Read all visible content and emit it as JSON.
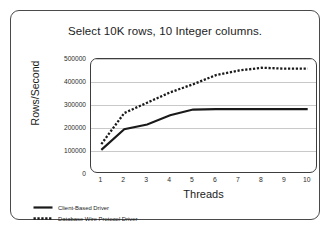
{
  "chart_data": {
    "type": "line",
    "title": "Select 10K rows, 10 Integer columns.",
    "xlabel": "Threads",
    "ylabel": "Rows/Second",
    "x": [
      1,
      2,
      3,
      4,
      5,
      6,
      7,
      8,
      9,
      10
    ],
    "xticklabels": [
      "1",
      "2",
      "3",
      "4",
      "5",
      "6",
      "7",
      "8",
      "9",
      "10"
    ],
    "yticks": [
      0,
      100000,
      200000,
      300000,
      400000,
      500000
    ],
    "yticklabels": [
      "0",
      "100000",
      "200000",
      "300000",
      "400000",
      "500000"
    ],
    "ylim": [
      0,
      500000
    ],
    "xlim": [
      0.55,
      10.45
    ],
    "grid": "horizontal",
    "legend_position": "below-left",
    "series": [
      {
        "name": "Client-Based Driver",
        "style": "solid",
        "color": "#1a1a1a",
        "values": [
          105000,
          195000,
          215000,
          255000,
          280000,
          282000,
          282000,
          282000,
          282000,
          282000
        ]
      },
      {
        "name": "Database Wire Protocol Driver",
        "style": "dotted",
        "color": "#1a1a1a",
        "values": [
          130000,
          265000,
          310000,
          355000,
          390000,
          430000,
          450000,
          462000,
          458000,
          458000
        ]
      }
    ]
  },
  "legend": {
    "items": [
      {
        "label": "Client-Based Driver",
        "style": "solid"
      },
      {
        "label": "Database Wire Protocol Driver",
        "style": "dotted"
      }
    ]
  }
}
